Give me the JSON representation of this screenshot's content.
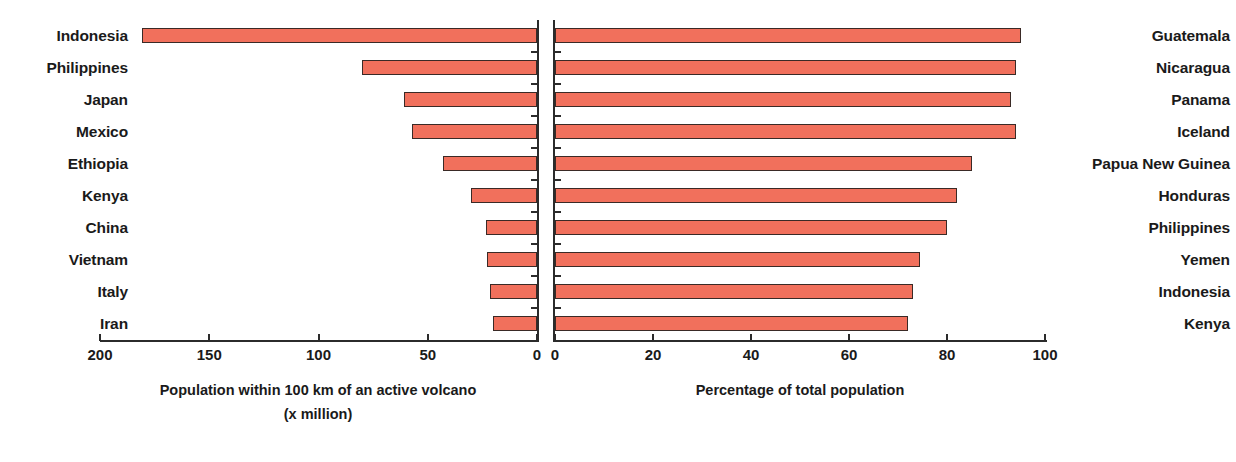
{
  "chart_data": {
    "type": "bar",
    "title": "",
    "orientation": "horizontal",
    "layout": "back-to-back paired panels, shared bar color, no legend, grid off",
    "bar_color": "#F1705C",
    "bar_outline_color": "#3A2A26",
    "panels": [
      {
        "id": "left",
        "xlabel_line1": "Population within 100 km of an active volcano",
        "xlabel_line2": "(x million)",
        "xlabel": "Population within 100 km of an active volcano (x million)",
        "direction": "right-to-left",
        "xlim": [
          0,
          200
        ],
        "xticks": [
          200,
          150,
          100,
          50,
          0
        ],
        "xtick_labels": [
          "200",
          "150",
          "100",
          "50",
          "0"
        ],
        "categories": [
          "Indonesia",
          "Philippines",
          "Japan",
          "Mexico",
          "Ethiopia",
          "Kenya",
          "China",
          "Vietnam",
          "Italy",
          "Iran"
        ],
        "values": [
          181,
          80,
          61,
          57,
          43,
          30,
          23.5,
          23,
          21.5,
          20
        ]
      },
      {
        "id": "right",
        "xlabel": "Percentage of total population",
        "direction": "left-to-right",
        "xlim": [
          0,
          100
        ],
        "xticks": [
          0,
          20,
          40,
          60,
          80,
          100
        ],
        "xtick_labels": [
          "0",
          "20",
          "40",
          "60",
          "80",
          "100"
        ],
        "categories": [
          "Guatemala",
          "Nicaragua",
          "Panama",
          "Iceland",
          "Papua New Guinea",
          "Honduras",
          "Philippines",
          "Yemen",
          "Indonesia",
          "Kenya"
        ],
        "values": [
          95,
          94,
          93,
          94,
          85,
          82,
          80,
          74.5,
          73,
          72
        ]
      }
    ]
  }
}
